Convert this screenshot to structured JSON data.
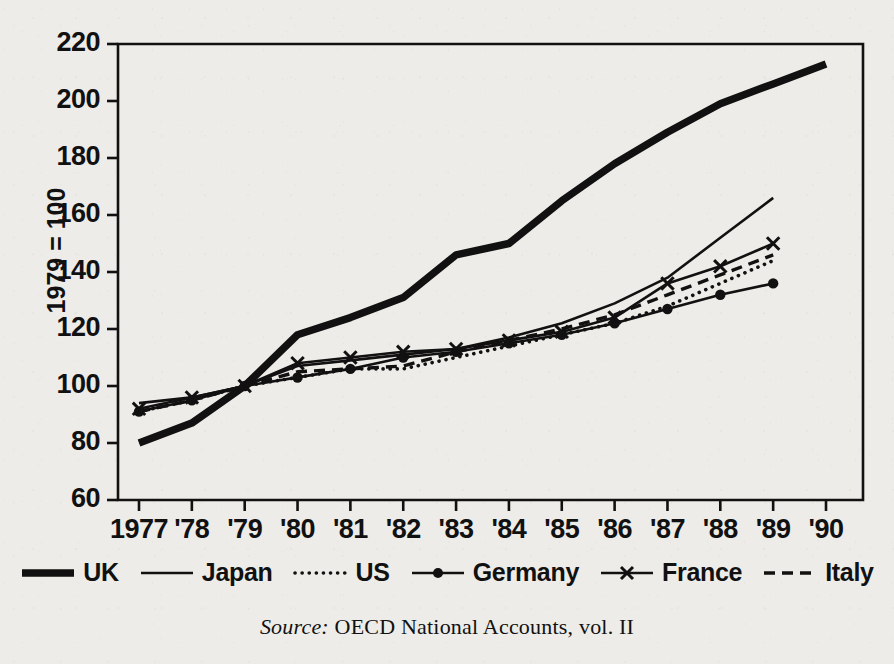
{
  "figure": {
    "background_color": "#eeece8",
    "ink_color": "#111111"
  },
  "axes": {
    "y_title": "1979 = 100",
    "y_ticks": [
      60,
      80,
      100,
      120,
      140,
      160,
      180,
      200,
      220
    ],
    "x_ticks": [
      "1977",
      "'78",
      "'79",
      "'80",
      "'81",
      "'82",
      "'83",
      "'84",
      "'85",
      "'86",
      "'87",
      "'88",
      "'89",
      "'90"
    ]
  },
  "source": {
    "prefix": "Source:",
    "text": "OECD National Accounts, vol. II"
  },
  "legend": {
    "items": [
      {
        "label": "UK",
        "style": "thick-solid"
      },
      {
        "label": "Japan",
        "style": "thin-solid"
      },
      {
        "label": "US",
        "style": "dotted"
      },
      {
        "label": "Germany",
        "style": "solid-dot-marker"
      },
      {
        "label": "France",
        "style": "solid-x-marker"
      },
      {
        "label": "Italy",
        "style": "dashed"
      }
    ]
  },
  "chart_data": {
    "type": "line",
    "title": "",
    "subtitle": "",
    "xlabel": "",
    "ylabel": "1979 = 100",
    "xlim": [
      "1977",
      "1990"
    ],
    "ylim": [
      60,
      220
    ],
    "grid": false,
    "legend_position": "bottom",
    "x": [
      1977,
      1978,
      1979,
      1980,
      1981,
      1982,
      1983,
      1984,
      1985,
      1986,
      1987,
      1988,
      1989,
      1990
    ],
    "annotations": [],
    "series": [
      {
        "name": "UK",
        "style": "thick-solid",
        "color": "#111111",
        "values": [
          80,
          87,
          100,
          118,
          124,
          131,
          146,
          150,
          165,
          178,
          189,
          199,
          206,
          213
        ]
      },
      {
        "name": "Japan",
        "style": "thin-solid",
        "color": "#111111",
        "values": [
          94,
          96,
          100,
          107,
          109,
          111,
          113,
          117,
          122,
          129,
          138,
          152,
          166,
          null
        ]
      },
      {
        "name": "US",
        "style": "dotted",
        "color": "#111111",
        "values": [
          91,
          95,
          100,
          103,
          106,
          106,
          110,
          114,
          118,
          122,
          128,
          136,
          144,
          null
        ]
      },
      {
        "name": "Germany",
        "style": "solid-dot-marker",
        "color": "#111111",
        "values": [
          91,
          95,
          100,
          103,
          106,
          110,
          112,
          115,
          118,
          122,
          127,
          132,
          136,
          null
        ]
      },
      {
        "name": "France",
        "style": "solid-x-marker",
        "color": "#111111",
        "values": [
          92,
          96,
          100,
          108,
          110,
          112,
          113,
          116,
          119,
          124,
          136,
          142,
          150,
          null
        ]
      },
      {
        "name": "Italy",
        "style": "dashed",
        "color": "#111111",
        "values": [
          91,
          95,
          100,
          105,
          106,
          107,
          112,
          116,
          120,
          125,
          132,
          139,
          146,
          null
        ]
      }
    ]
  }
}
